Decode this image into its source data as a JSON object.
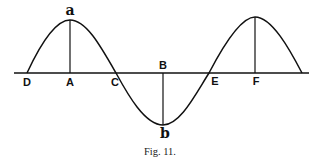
{
  "figure": {
    "caption": "Fig. 11.",
    "stroke_color": "#111111",
    "background": "#ffffff"
  },
  "labels": {
    "D": "D",
    "A": "A",
    "C": "C",
    "B": "B",
    "E": "E",
    "F": "F",
    "a": "a",
    "b": "b"
  },
  "diagram": {
    "type": "sine wave with crests and trough",
    "axis_points": [
      "D",
      "A",
      "C",
      "B",
      "E",
      "F"
    ],
    "crest_label": "a",
    "trough_label": "b",
    "vertical_lines": [
      "A-a",
      "B-b",
      "F-crest"
    ]
  }
}
